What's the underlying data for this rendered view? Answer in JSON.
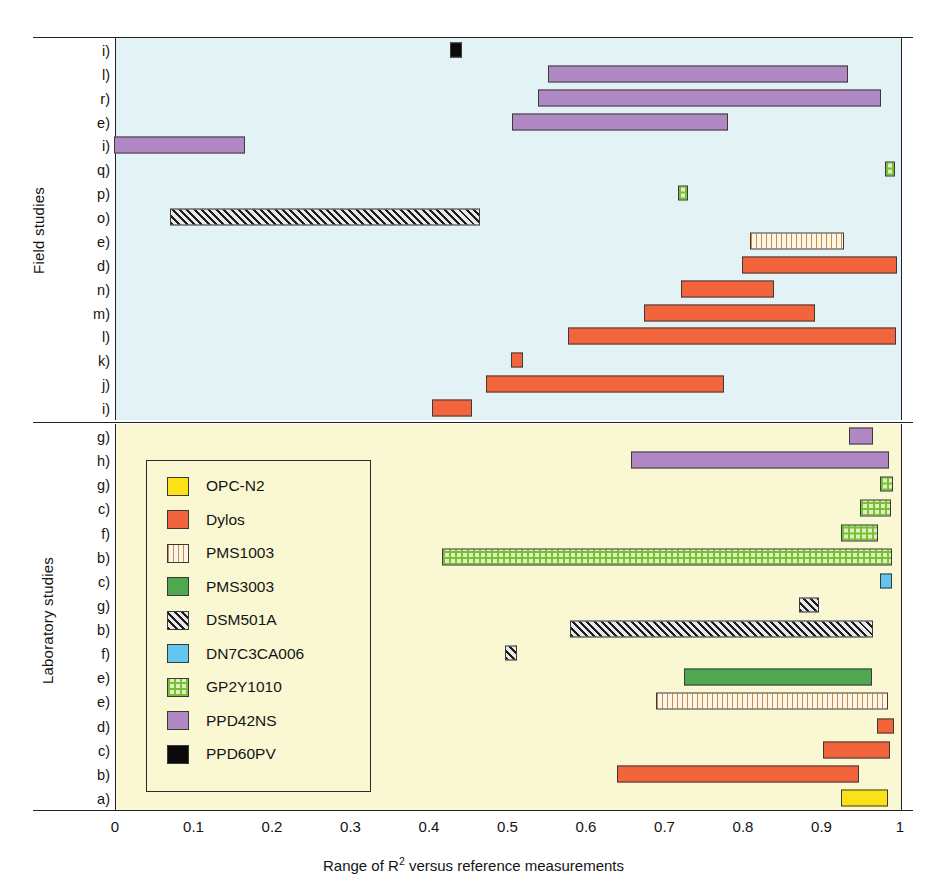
{
  "chart_data": {
    "type": "bar",
    "orientation": "horizontal",
    "subtype": "range-bar",
    "title": "",
    "xlabel": "Range of R2 versus reference measurements",
    "xlabel_parts": {
      "before": "Range of R",
      "sup": "2",
      "after": " versus reference measurements"
    },
    "ylabel": "",
    "xlim": [
      0,
      1
    ],
    "xticks": [
      "0",
      "0.1",
      "0.2",
      "0.3",
      "0.4",
      "0.5",
      "0.6",
      "0.7",
      "0.8",
      "0.9",
      "1"
    ],
    "xtick_values": [
      0,
      0.1,
      0.2,
      0.3,
      0.4,
      0.5,
      0.6,
      0.7,
      0.8,
      0.9,
      1
    ],
    "grid": false,
    "legend_position": "inside-lower-left",
    "panels": [
      {
        "name": "Field studies",
        "background": "#e2f2f5",
        "rows": [
          {
            "label": "i)",
            "sensor": "PPD60PV",
            "start": 0.427,
            "end": 0.443
          },
          {
            "label": "l)",
            "sensor": "PPD42NS",
            "start": 0.552,
            "end": 0.935
          },
          {
            "label": "r)",
            "sensor": "PPD42NS",
            "start": 0.54,
            "end": 0.977
          },
          {
            "label": "e)",
            "sensor": "PPD42NS",
            "start": 0.507,
            "end": 0.782
          },
          {
            "label": "i)",
            "sensor": "PPD42NS",
            "start": 0.0,
            "end": 0.166
          },
          {
            "label": "q)",
            "sensor": "GP2Y1010",
            "start": 0.982,
            "end": 0.995
          },
          {
            "label": "p)",
            "sensor": "GP2Y1010",
            "start": 0.718,
            "end": 0.731
          },
          {
            "label": "o)",
            "sensor": "DSM501A",
            "start": 0.071,
            "end": 0.466
          },
          {
            "label": "e)",
            "sensor": "PMS1003",
            "start": 0.81,
            "end": 0.93
          },
          {
            "label": "d)",
            "sensor": "Dylos",
            "start": 0.8,
            "end": 0.997
          },
          {
            "label": "n)",
            "sensor": "Dylos",
            "start": 0.722,
            "end": 0.84
          },
          {
            "label": "m)",
            "sensor": "Dylos",
            "start": 0.675,
            "end": 0.892
          },
          {
            "label": "l)",
            "sensor": "Dylos",
            "start": 0.578,
            "end": 0.996
          },
          {
            "label": "k)",
            "sensor": "Dylos",
            "start": 0.505,
            "end": 0.52
          },
          {
            "label": "j)",
            "sensor": "Dylos",
            "start": 0.473,
            "end": 0.777
          },
          {
            "label": "i)",
            "sensor": "Dylos",
            "start": 0.405,
            "end": 0.455
          }
        ]
      },
      {
        "name": "Laboratory studies",
        "background": "#faf8d2",
        "rows": [
          {
            "label": "g)",
            "sensor": "PPD42NS",
            "start": 0.936,
            "end": 0.966
          },
          {
            "label": "h)",
            "sensor": "PPD42NS",
            "start": 0.658,
            "end": 0.987
          },
          {
            "label": "g)",
            "sensor": "GP2Y1010",
            "start": 0.975,
            "end": 0.992
          },
          {
            "label": "c)",
            "sensor": "GP2Y1010",
            "start": 0.95,
            "end": 0.989
          },
          {
            "label": "f)",
            "sensor": "GP2Y1010",
            "start": 0.925,
            "end": 0.973
          },
          {
            "label": "b)",
            "sensor": "GP2Y1010",
            "start": 0.417,
            "end": 0.99
          },
          {
            "label": "c)",
            "sensor": "DN7C3CA006",
            "start": 0.975,
            "end": 0.99
          },
          {
            "label": "g)",
            "sensor": "DSM501A",
            "start": 0.872,
            "end": 0.897
          },
          {
            "label": "b)",
            "sensor": "DSM501A",
            "start": 0.58,
            "end": 0.967
          },
          {
            "label": "f)",
            "sensor": "DSM501A",
            "start": 0.497,
            "end": 0.513
          },
          {
            "label": "e)",
            "sensor": "PMS3003",
            "start": 0.725,
            "end": 0.965
          },
          {
            "label": "e)",
            "sensor": "PMS1003",
            "start": 0.69,
            "end": 0.986
          },
          {
            "label": "d)",
            "sensor": "Dylos",
            "start": 0.972,
            "end": 0.993
          },
          {
            "label": "c)",
            "sensor": "Dylos",
            "start": 0.903,
            "end": 0.988
          },
          {
            "label": "b)",
            "sensor": "Dylos",
            "start": 0.64,
            "end": 0.948
          },
          {
            "label": "a)",
            "sensor": "OPC-N2",
            "start": 0.925,
            "end": 0.985
          }
        ]
      }
    ],
    "legend": [
      {
        "label": "OPC-N2",
        "color": "#fbe216",
        "pattern": "solid"
      },
      {
        "label": "Dylos",
        "color": "#f2653c",
        "pattern": "solid"
      },
      {
        "label": "PMS1003",
        "color": "#fdf6e6",
        "pattern": "vertical-lines"
      },
      {
        "label": "PMS3003",
        "color": "#4fa84f",
        "pattern": "solid"
      },
      {
        "label": "DSM501A",
        "color": "#cfcfcf",
        "pattern": "diagonal-hatch"
      },
      {
        "label": "DN7C3CA006",
        "color": "#63c6f0",
        "pattern": "solid"
      },
      {
        "label": "GP2Y1010",
        "color": "#dff0b9",
        "pattern": "crosshatch-grid"
      },
      {
        "label": "PPD42NS",
        "color": "#b089c4",
        "pattern": "solid"
      },
      {
        "label": "PPD60PV",
        "color": "#0a0a0a",
        "pattern": "solid"
      }
    ]
  }
}
